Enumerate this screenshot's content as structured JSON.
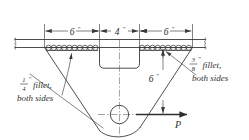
{
  "drawing": {
    "title": "Welded bracket connection detail",
    "type": "engineering-drawing",
    "background_color": "#ffffff",
    "line_color": "#3a3a3a",
    "dimensions": {
      "horizontal": [
        {
          "id": "left-span",
          "label": "6",
          "unit": "″",
          "value": 6
        },
        {
          "id": "center-notch",
          "label": "4",
          "unit": "″",
          "value": 4
        },
        {
          "id": "right-span",
          "label": "6",
          "unit": "″",
          "value": 6
        }
      ],
      "vertical": [
        {
          "id": "depth",
          "label": "6",
          "unit": "″",
          "value": 6
        }
      ]
    },
    "weld_notes": {
      "left": {
        "numerator": "1",
        "denominator": "4",
        "unit": "″",
        "line1": "fillet,",
        "line2": "both sides",
        "full_text": "1/4″ fillet, both sides"
      },
      "right": {
        "numerator": "3",
        "denominator": "8",
        "unit": "″",
        "line1": "fillet,",
        "line2": "both sides",
        "full_text": "3/8″ fillet, both sides"
      }
    },
    "load": {
      "label": "P",
      "direction": "right",
      "description": "applied horizontal force"
    },
    "features": {
      "hole": "bolt-hole",
      "break_symbols": 2,
      "weld_symbol_style": "scalloped-fillet-weld"
    }
  }
}
